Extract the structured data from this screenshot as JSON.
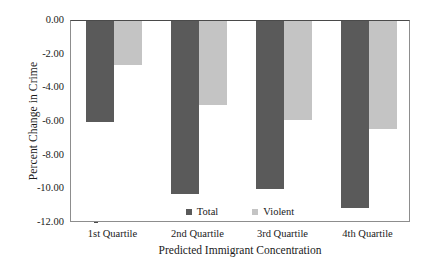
{
  "chart_data": {
    "type": "bar",
    "title": "",
    "xlabel": "Predicted Immigrant Concentration",
    "ylabel": "Percent Change in Crime",
    "categories": [
      "1st Quartile",
      "2nd Quartile",
      "3rd Quartile",
      "4th Quartile"
    ],
    "series": [
      {
        "name": "Total",
        "color": "#5a5a5a",
        "values": [
          -6.0,
          -10.3,
          -10.0,
          -11.1
        ]
      },
      {
        "name": "Violent",
        "color": "#c4c4c4",
        "values": [
          -2.6,
          -5.0,
          -5.9,
          -6.4
        ]
      }
    ],
    "ylim": [
      -12.0,
      0.0
    ],
    "ytick_values": [
      0.0,
      -2.0,
      -4.0,
      -6.0,
      -8.0,
      -10.0,
      -12.0
    ],
    "ytick_labels": [
      "0.00",
      "-2.00",
      "-4.00",
      "-6.00",
      "-8.00",
      "-10.00",
      "-12.00"
    ],
    "grid": false,
    "legend_position": "inside-bottom-center",
    "legend_entries": [
      "Total",
      "Violent"
    ]
  },
  "figure": {
    "background_color": "#ffffff",
    "frame_color": "#8d8d8d",
    "text_color": "#1a1a1a"
  }
}
